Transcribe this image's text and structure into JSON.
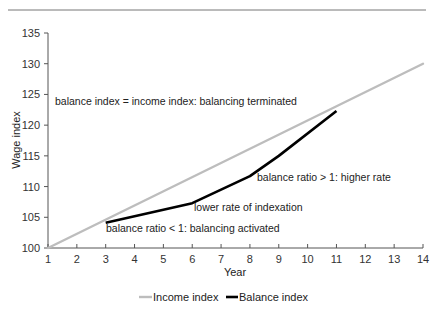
{
  "chart_data": {
    "type": "line",
    "title": "",
    "xlabel": "Year",
    "ylabel": "Wage index",
    "xlim": [
      1,
      14
    ],
    "ylim": [
      100,
      135
    ],
    "x_ticks": [
      1,
      2,
      3,
      4,
      5,
      6,
      7,
      8,
      9,
      10,
      11,
      12,
      13,
      14
    ],
    "y_ticks": [
      100,
      105,
      110,
      115,
      120,
      125,
      130,
      135
    ],
    "grid": false,
    "legend_position": "bottom",
    "series": [
      {
        "name": "Income index",
        "color": "#bdbdbd",
        "x": [
          1,
          14
        ],
        "values": [
          100,
          130
        ]
      },
      {
        "name": "Balance index",
        "color": "#000000",
        "x": [
          3,
          6,
          8,
          9,
          11
        ],
        "values": [
          104.1,
          107.3,
          111.7,
          115.0,
          122.3
        ]
      }
    ],
    "annotations": [
      {
        "text": "balance index = income index: balancing terminated",
        "x": 2.2,
        "y": 123.3
      },
      {
        "text": "balance ratio > 1: higher rate",
        "x": 8.8,
        "y": 110.9
      },
      {
        "text": "lower rate of indexation",
        "x": 6.0,
        "y": 106.2
      },
      {
        "text": "balance ratio < 1: balancing activated",
        "x": 3.0,
        "y": 102.4
      }
    ]
  },
  "labels": {
    "xlabel": "Year",
    "ylabel": "Wage index",
    "legend": [
      "Income index",
      "Balance index"
    ],
    "annotations": [
      "balance index = income index: balancing terminated",
      "balance ratio > 1: higher rate",
      "lower rate of indexation",
      "balance ratio < 1: balancing activated"
    ]
  }
}
